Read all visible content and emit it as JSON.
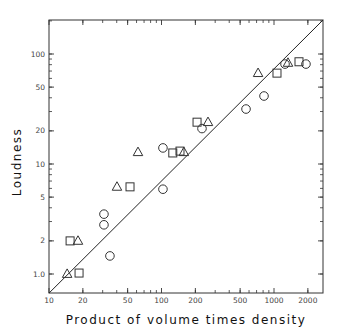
{
  "chart_data": {
    "type": "scatter",
    "title": "",
    "xlabel": "Product of volume times density",
    "ylabel": "Loudness",
    "xscale": "log",
    "yscale": "log",
    "xlim": [
      10,
      2730
    ],
    "ylim": [
      0.67,
      204
    ],
    "grid": false,
    "legend": null,
    "x_ticks": [
      10,
      20,
      50,
      100,
      200,
      500,
      1000,
      2000
    ],
    "x_tick_labels": [
      "10",
      "20",
      "50",
      "100",
      "200",
      "500",
      "1000",
      "2000"
    ],
    "y_ticks": [
      1.0,
      2,
      5,
      10,
      20,
      50,
      100
    ],
    "y_tick_labels": [
      "1.0",
      "2",
      "5",
      "10",
      "20",
      "50",
      "100"
    ],
    "series": [
      {
        "name": "circles",
        "marker": "circle",
        "points": [
          [
            30.8,
            3.5
          ],
          [
            30.8,
            2.8
          ],
          [
            34.8,
            1.46
          ],
          [
            103,
            5.9
          ],
          [
            103,
            14
          ],
          [
            229,
            21
          ],
          [
            564,
            31.6
          ],
          [
            815,
            41.5
          ],
          [
            1253,
            81
          ],
          [
            1924,
            81
          ]
        ]
      },
      {
        "name": "squares",
        "marker": "square",
        "points": [
          [
            18.5,
            1.02
          ],
          [
            15.4,
            2.0
          ],
          [
            52.5,
            6.2
          ],
          [
            126,
            12.6
          ],
          [
            146,
            13.1
          ],
          [
            207,
            24
          ],
          [
            1063,
            67
          ],
          [
            1668,
            85
          ]
        ]
      },
      {
        "name": "triangles",
        "marker": "triangle",
        "points": [
          [
            14.5,
            1.0
          ],
          [
            18.1,
            2.0
          ],
          [
            40.2,
            6.2
          ],
          [
            61.8,
            12.8
          ],
          [
            158,
            12.8
          ],
          [
            259,
            24
          ],
          [
            722,
            67
          ],
          [
            1332,
            83
          ]
        ]
      }
    ],
    "reference_line": {
      "type": "line",
      "points": [
        [
          10,
          0.67
        ],
        [
          2730,
          204
        ]
      ]
    }
  }
}
